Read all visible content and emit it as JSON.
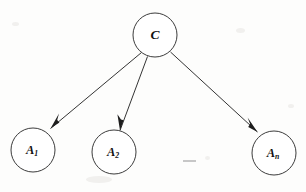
{
  "figure": {
    "kind": "directed-graph",
    "background_color": "#fdfdfc",
    "stroke_color": "#1d1d1d",
    "node_fill": "#ffffff"
  },
  "nodes": [
    {
      "id": "C",
      "role": "class-node",
      "label_main": "C",
      "label_sub": "",
      "cx": 155,
      "cy": 35,
      "r": 22
    },
    {
      "id": "A1",
      "role": "attribute-node",
      "label_main": "A",
      "label_sub": "1",
      "cx": 33,
      "cy": 150,
      "r": 22
    },
    {
      "id": "A2",
      "role": "attribute-node",
      "label_main": "A",
      "label_sub": "2",
      "cx": 114,
      "cy": 152,
      "r": 22
    },
    {
      "id": "An",
      "role": "attribute-node",
      "label_main": "A",
      "label_sub": "n",
      "cx": 274,
      "cy": 153,
      "r": 22
    }
  ],
  "edges": [
    {
      "id": "edge-c-a1",
      "from": "C",
      "to": "A1",
      "x1": 141.5,
      "y1": 52.5,
      "x2": 50.5,
      "y2": 128.5,
      "directed": true
    },
    {
      "id": "edge-c-a2",
      "from": "C",
      "to": "A2",
      "x1": 147.5,
      "y1": 56.5,
      "x2": 120.0,
      "y2": 130.5,
      "directed": true
    },
    {
      "id": "edge-c-an",
      "from": "C",
      "to": "An",
      "x1": 170.5,
      "y1": 52.0,
      "x2": 257.5,
      "y2": 132.0,
      "directed": true
    }
  ],
  "ellipsis": {
    "id": "attribute-ellipsis",
    "text": "—",
    "x1": 183,
    "y1": 161,
    "x2": 196,
    "y2": 161
  }
}
